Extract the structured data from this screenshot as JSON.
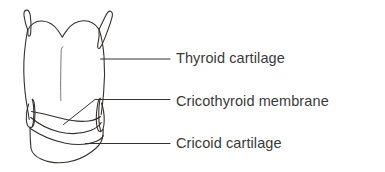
{
  "figure": {
    "type": "anatomical-line-drawing",
    "background_color": "#ffffff",
    "stroke_color": "#33302e",
    "text_color": "#3a3a3a",
    "width": 385,
    "height": 172,
    "structures": [
      {
        "name": "thyroid-cartilage",
        "description": "Large shield-shaped cartilage with superior horns and a midline notch at the top"
      },
      {
        "name": "cricothyroid-membrane",
        "description": "Membrane spanning between the lower thyroid cartilage border and the cricoid cartilage"
      },
      {
        "name": "cricoid-cartilage",
        "description": "Ring-shaped cartilage forming the base of the larynx"
      }
    ]
  },
  "labels": [
    {
      "id": "thyroid",
      "text": "Thyroid cartilage",
      "leader": "horizontal line from cartilage edge to label"
    },
    {
      "id": "membrane",
      "text": "Cricothyroid membrane",
      "leader": "bent line with diagonal segment into the membrane"
    },
    {
      "id": "cricoid",
      "text": "Cricoid cartilage",
      "leader": "horizontal line from cricoid ring to label"
    }
  ]
}
